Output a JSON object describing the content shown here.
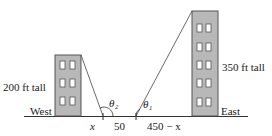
{
  "diagram": {
    "west_building": {
      "height_label": "200 ft tall",
      "side_label": "West",
      "window_rows": 3
    },
    "east_building": {
      "height_label": "350 ft tall",
      "side_label": "East",
      "window_rows": 5
    },
    "angles": {
      "theta2": "θ₂",
      "theta1": "θ₁"
    },
    "segments": {
      "left": "x",
      "middle": "50",
      "right": "450 − x"
    }
  },
  "colors": {
    "building_fill": "#b8b8b8",
    "building_stroke": "#555555",
    "line": "#333333",
    "window_fill": "#ffffff"
  }
}
